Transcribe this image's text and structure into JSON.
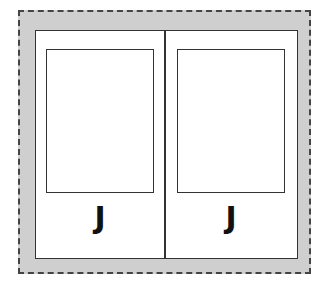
{
  "cards": [
    {
      "letter": "J"
    },
    {
      "letter": "J"
    }
  ],
  "colors": {
    "background_border": "#cfcfcf",
    "line": "#333333"
  }
}
